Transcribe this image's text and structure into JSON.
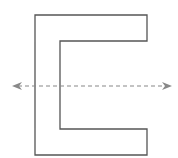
{
  "diagram": {
    "title": "",
    "shape": {
      "name": "c-shape",
      "stroke": "#555555",
      "fill": "#ffffff",
      "points": "35,15 147,15 147,41 60,41 60,129 147,129 147,155 35,155"
    },
    "symmetry_line": {
      "name": "line-of-symmetry",
      "orientation": "horizontal",
      "style": "dashed",
      "color": "#888888",
      "x1": 12,
      "x2": 172,
      "y": 86,
      "arrows": "both"
    }
  }
}
